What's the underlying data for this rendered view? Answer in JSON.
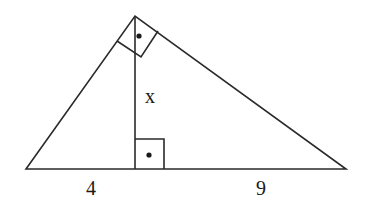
{
  "diagram": {
    "type": "right-triangle-altitude",
    "vertices": {
      "left": [
        26,
        169
      ],
      "right": [
        346,
        169
      ],
      "top": [
        135,
        16
      ],
      "foot": [
        135,
        169
      ]
    },
    "labels": {
      "altitude": "x",
      "left_segment": "4",
      "right_segment": "9"
    },
    "right_angle_markers": [
      "apex",
      "foot-of-altitude"
    ],
    "colors": {
      "stroke": "#2a2a2a",
      "background": "#ffffff"
    }
  }
}
